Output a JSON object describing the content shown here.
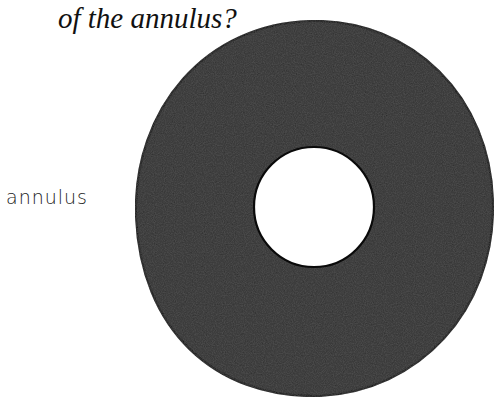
{
  "question": {
    "text": "of the annulus?"
  },
  "figure": {
    "label": "annulus",
    "shape": "annulus",
    "fill_color": "#2e2e2e",
    "outline_color": "#0a0a0a",
    "hole_color": "#ffffff",
    "outer": {
      "cx": 314,
      "cy": 208,
      "rx": 178,
      "ry": 187
    },
    "inner": {
      "cx": 314,
      "cy": 207,
      "r": 60
    }
  }
}
